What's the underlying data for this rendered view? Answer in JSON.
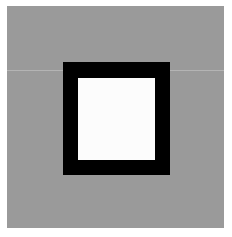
{
  "image": {
    "description": "Gray background with a black square frame surrounding a white square",
    "colors": {
      "background": "#9a9a9a",
      "frame": "#000000",
      "inner": "#fcfcfc",
      "line": "#b4b4b4"
    }
  },
  "caption": {
    "text": ""
  }
}
